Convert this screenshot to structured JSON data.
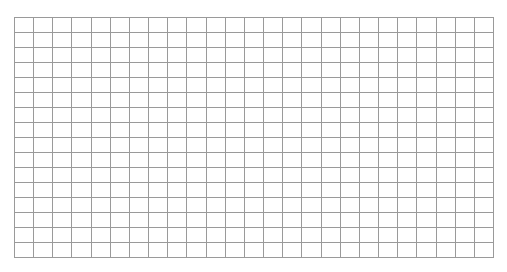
{
  "grid": {
    "columns": 25,
    "rows": 16,
    "line_color": "#9a9a9a",
    "background_color": "#ffffff"
  }
}
